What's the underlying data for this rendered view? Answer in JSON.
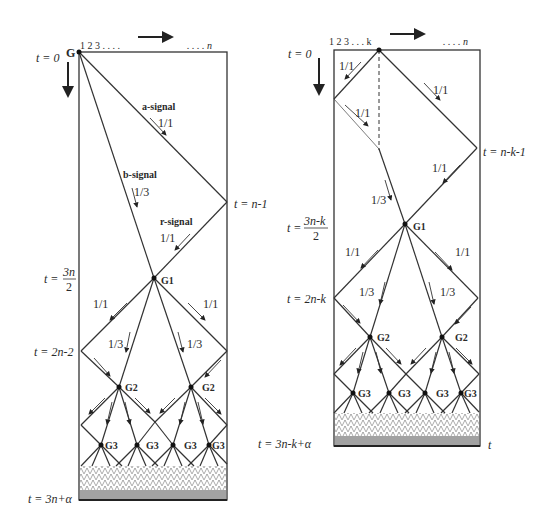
{
  "left_diagram": {
    "cell_labels": {
      "start": "1 2 3 . . . .",
      "end": ". . . . n"
    },
    "general_label": "G",
    "time_labels": {
      "t0": "t = 0",
      "t_n_minus_1": "t = n-1",
      "t_3n_over_2_prefix": "t =",
      "t_3n_over_2_num": "3n",
      "t_3n_over_2_den": "2",
      "t_2n_minus_2": "t = 2n-2",
      "t_final": "t = 3n+α"
    },
    "signals": {
      "a": {
        "name": "a-signal",
        "speed": "1/1"
      },
      "b": {
        "name": "b-signal",
        "speed": "1/3"
      },
      "r": {
        "name": "r-signal",
        "speed": "1/1"
      }
    },
    "speed_labels": [
      "1/1",
      "1/1",
      "1/3",
      "1/3"
    ],
    "generals": {
      "g1": "G1",
      "g2": [
        "G2",
        "G2"
      ],
      "g3": [
        "G3",
        "G3",
        "G3",
        "G3"
      ]
    }
  },
  "right_diagram": {
    "cell_labels": {
      "start": "1 2 3 . . . k",
      "end": ". . . . n"
    },
    "time_labels": {
      "t0": "t = 0",
      "t_n_k_1": "t = n-k-1",
      "t_3nk_prefix": "t =",
      "t_3nk_num": "3n-k",
      "t_3nk_den": "2",
      "t_2n_k": "t = 2n-k",
      "t_final": "t = 3n-k+α",
      "t_axis": "t"
    },
    "speed_labels": [
      "1/1",
      "1/1",
      "1/1",
      "1/1",
      "1/3",
      "1/1",
      "1/1",
      "1/3",
      "1/3"
    ],
    "generals": {
      "g1": "G1",
      "g2": [
        "G2",
        "G2"
      ],
      "g3": [
        "G3",
        "G3",
        "G3",
        "G3"
      ]
    }
  }
}
